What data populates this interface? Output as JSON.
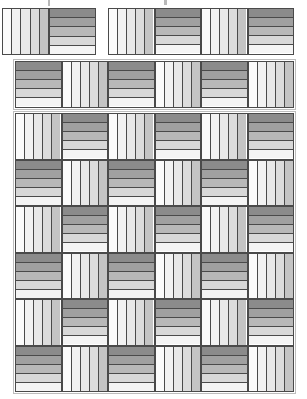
{
  "figure": {
    "type": "pattern-diagram",
    "canvas": {
      "width": 307,
      "height": 399,
      "background": "#ffffff"
    },
    "block": {
      "stripe_count": 5,
      "orientations": [
        "vertical",
        "horizontal"
      ],
      "border_color": "#4a4a4a",
      "size_px": 46,
      "gradient_stops_light_to_dark": [
        "#f7f7f7",
        "#ededed",
        "#dcdcdc",
        "#c2c2c2",
        "#a8a8a8"
      ],
      "gradient_stops_dark_to_light": [
        "#8a8a8a",
        "#9e9e9e",
        "#b5b5b5",
        "#d4d4d4",
        "#f2f2f2"
      ],
      "vertical_stripe_colors": [
        "#fbfbfb",
        "#f2f2f2",
        "#e8e8e8",
        "#dcdcdc",
        "#c4c4c4"
      ],
      "horizontal_stripe_colors": [
        "#8b8b8b",
        "#a0a0a0",
        "#b8b8b8",
        "#d8d8d8",
        "#f4f4f4"
      ]
    },
    "regions": [
      {
        "name": "top-partial-row-left",
        "x": 2,
        "y": 8,
        "cols": 2,
        "rows": 1,
        "cell": 47,
        "start_orientation": "vertical",
        "frame": false
      },
      {
        "name": "top-partial-row-right",
        "x": 108,
        "y": 8,
        "cols": 4,
        "rows": 1,
        "cell": 46.5,
        "start_orientation": "vertical",
        "frame": false
      },
      {
        "name": "second-partial-row",
        "x": 15,
        "y": 61,
        "cols": 6,
        "rows": 1,
        "cell": 46.5,
        "start_orientation": "horizontal",
        "frame": true
      },
      {
        "name": "main-grid",
        "x": 15,
        "y": 113,
        "cols": 6,
        "rows": 6,
        "cell": 46.5,
        "start_orientation": "vertical",
        "frame": true
      }
    ],
    "frame_color": "#bdbdbd",
    "artifacts": [
      {
        "x": 48,
        "y": 0,
        "w": 2,
        "h": 6
      },
      {
        "x": 164,
        "y": 0,
        "w": 3,
        "h": 5
      }
    ],
    "labels": {
      "caption": ""
    }
  }
}
